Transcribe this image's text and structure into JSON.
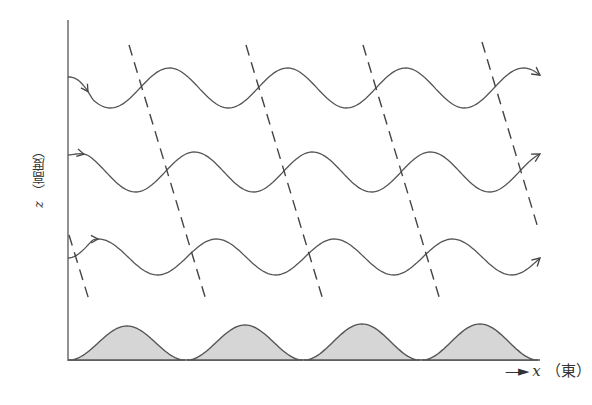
{
  "figure": {
    "type": "diagram",
    "x_axis": {
      "variable": "x",
      "label_suffix": "（東）",
      "arrow": "→"
    },
    "z_axis": {
      "variable": "z",
      "label_suffix": "（高度）"
    },
    "colors": {
      "line": "#555555",
      "terrain_fill": "#d6d6d6",
      "background": "#ffffff"
    }
  },
  "streamlines": [
    {
      "name": "upper-streamline",
      "start_y": 77,
      "mean_y": 88,
      "amplitude": 20,
      "wavelength": 118,
      "end_arrow": true
    },
    {
      "name": "middle-streamline",
      "start_y": 155,
      "mean_y": 172,
      "amplitude": 20,
      "wavelength": 118,
      "end_arrow": true
    },
    {
      "name": "lower-streamline",
      "start_y": 258,
      "mean_y": 257,
      "amplitude": 18,
      "wavelength": 118,
      "end_arrow": true
    }
  ],
  "phase_lines": [
    {
      "x1": 69,
      "y1": 235,
      "x2": 89,
      "y2": 300
    },
    {
      "x1": 129,
      "y1": 45,
      "x2": 206,
      "y2": 300
    },
    {
      "x1": 246,
      "y1": 45,
      "x2": 323,
      "y2": 300
    },
    {
      "x1": 363,
      "y1": 45,
      "x2": 440,
      "y2": 300
    },
    {
      "x1": 482,
      "y1": 42,
      "x2": 538,
      "y2": 228
    }
  ],
  "terrain_bumps": [
    {
      "center_x": 127,
      "peak_y": 326
    },
    {
      "center_x": 245,
      "peak_y": 325
    },
    {
      "center_x": 362,
      "peak_y": 324
    },
    {
      "center_x": 480,
      "peak_y": 324
    }
  ]
}
